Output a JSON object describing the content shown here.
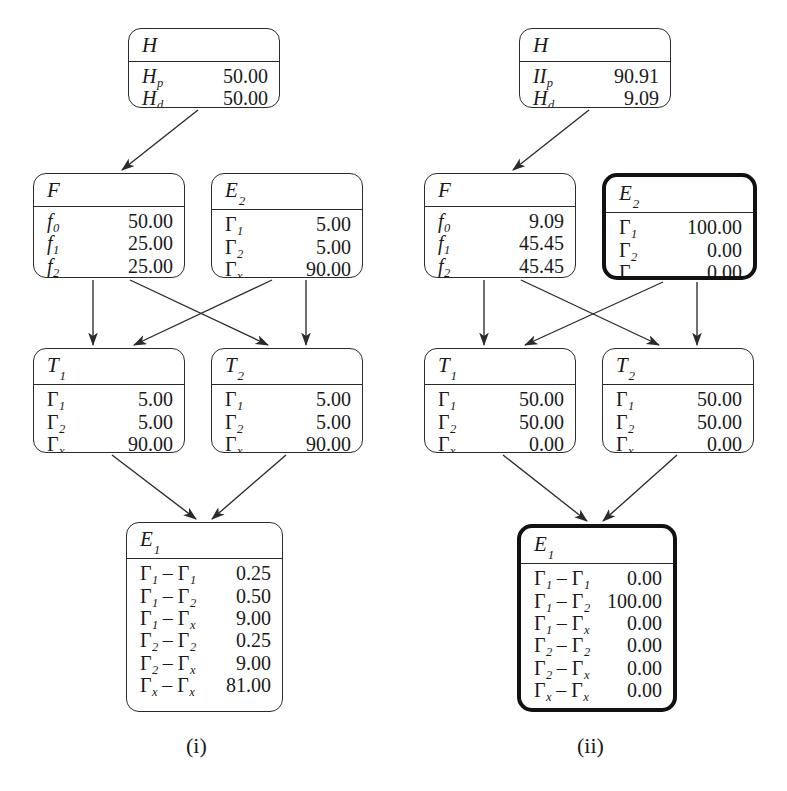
{
  "figure": {
    "background": "#ffffff",
    "line_color": "#2b2b2b",
    "panels": [
      {
        "caption": "(i)",
        "caption_x": 186,
        "caption_y": 733,
        "nodes": [
          {
            "id": "H",
            "title": "H",
            "title_sub": "",
            "x": 128,
            "y": 28,
            "w": 152,
            "h": 80,
            "emphasis": "normal",
            "rows": [
              {
                "key": "H",
                "key_sub": "p",
                "greek": false,
                "value": "50.00"
              },
              {
                "key": "H",
                "key_sub": "d",
                "greek": false,
                "value": "50.00"
              }
            ]
          },
          {
            "id": "F",
            "title": "F",
            "title_sub": "",
            "x": 33,
            "y": 173,
            "w": 152,
            "h": 105,
            "emphasis": "normal",
            "rows": [
              {
                "key": "f",
                "key_sub": "0",
                "greek": false,
                "value": "50.00"
              },
              {
                "key": "f",
                "key_sub": "1",
                "greek": false,
                "value": "25.00"
              },
              {
                "key": "f",
                "key_sub": "2",
                "greek": false,
                "value": "25.00"
              }
            ]
          },
          {
            "id": "E2",
            "title": "E",
            "title_sub": "2",
            "x": 211,
            "y": 173,
            "w": 152,
            "h": 105,
            "emphasis": "normal",
            "rows": [
              {
                "key": "Γ",
                "key_sub": "1",
                "greek": true,
                "value": "5.00"
              },
              {
                "key": "Γ",
                "key_sub": "2",
                "greek": true,
                "value": "5.00"
              },
              {
                "key": "Γ",
                "key_sub": "x",
                "greek": true,
                "value": "90.00"
              }
            ]
          },
          {
            "id": "T1",
            "title": "T",
            "title_sub": "1",
            "x": 33,
            "y": 348,
            "w": 152,
            "h": 105,
            "emphasis": "normal",
            "rows": [
              {
                "key": "Γ",
                "key_sub": "1",
                "greek": true,
                "value": "5.00"
              },
              {
                "key": "Γ",
                "key_sub": "2",
                "greek": true,
                "value": "5.00"
              },
              {
                "key": "Γ",
                "key_sub": "x",
                "greek": true,
                "value": "90.00"
              }
            ]
          },
          {
            "id": "T2",
            "title": "T",
            "title_sub": "2",
            "x": 211,
            "y": 348,
            "w": 152,
            "h": 105,
            "emphasis": "normal",
            "rows": [
              {
                "key": "Γ",
                "key_sub": "1",
                "greek": true,
                "value": "5.00"
              },
              {
                "key": "Γ",
                "key_sub": "2",
                "greek": true,
                "value": "5.00"
              },
              {
                "key": "Γ",
                "key_sub": "x",
                "greek": true,
                "value": "90.00"
              }
            ]
          },
          {
            "id": "E1",
            "title": "E",
            "title_sub": "1",
            "x": 126,
            "y": 522,
            "w": 157,
            "h": 190,
            "emphasis": "normal",
            "rows": [
              {
                "key": "Γ|1| – Γ|1|",
                "key_sub": "",
                "greek": true,
                "value": "0.25"
              },
              {
                "key": "Γ|1| – Γ|2|",
                "key_sub": "",
                "greek": true,
                "value": "0.50"
              },
              {
                "key": "Γ|1| – Γ|x|",
                "key_sub": "",
                "greek": true,
                "value": "9.00"
              },
              {
                "key": "Γ|2| – Γ|2|",
                "key_sub": "",
                "greek": true,
                "value": "0.25"
              },
              {
                "key": "Γ|2| – Γ|x|",
                "key_sub": "",
                "greek": true,
                "value": "9.00"
              },
              {
                "key": "Γ|x| – Γ|x|",
                "key_sub": "",
                "greek": true,
                "value": "81.00"
              }
            ]
          }
        ],
        "edges": [
          {
            "from": "H",
            "to": "F",
            "x1": 198,
            "y1": 110,
            "x2": 122,
            "y2": 170
          },
          {
            "from": "F",
            "to": "T1",
            "x1": 93,
            "y1": 280,
            "x2": 93,
            "y2": 345
          },
          {
            "from": "F",
            "to": "T2",
            "x1": 130,
            "y1": 280,
            "x2": 268,
            "y2": 345
          },
          {
            "from": "E2",
            "to": "T1",
            "x1": 272,
            "y1": 280,
            "x2": 134,
            "y2": 345
          },
          {
            "from": "E2",
            "to": "T2",
            "x1": 306,
            "y1": 280,
            "x2": 306,
            "y2": 345
          },
          {
            "from": "T1",
            "to": "E1",
            "x1": 112,
            "y1": 455,
            "x2": 196,
            "y2": 519
          },
          {
            "from": "T2",
            "to": "E1",
            "x1": 286,
            "y1": 455,
            "x2": 212,
            "y2": 519
          }
        ]
      },
      {
        "caption": "(ii)",
        "caption_x": 577,
        "caption_y": 733,
        "nodes": [
          {
            "id": "H",
            "title": "H",
            "title_sub": "",
            "x": 519,
            "y": 28,
            "w": 152,
            "h": 80,
            "emphasis": "normal",
            "rows": [
              {
                "key": "II",
                "key_sub": "p",
                "greek": false,
                "value": "90.91"
              },
              {
                "key": "H",
                "key_sub": "d",
                "greek": false,
                "value": "9.09"
              }
            ]
          },
          {
            "id": "F",
            "title": "F",
            "title_sub": "",
            "x": 424,
            "y": 173,
            "w": 152,
            "h": 105,
            "emphasis": "normal",
            "rows": [
              {
                "key": "f",
                "key_sub": "0",
                "greek": false,
                "value": "9.09"
              },
              {
                "key": "f",
                "key_sub": "1",
                "greek": false,
                "value": "45.45"
              },
              {
                "key": "f",
                "key_sub": "2",
                "greek": false,
                "value": "45.45"
              }
            ]
          },
          {
            "id": "E2",
            "title": "E",
            "title_sub": "2",
            "x": 602,
            "y": 173,
            "w": 155,
            "h": 107,
            "emphasis": "thick",
            "rows": [
              {
                "key": "Γ",
                "key_sub": "1",
                "greek": true,
                "value": "100.00"
              },
              {
                "key": "Γ",
                "key_sub": "2",
                "greek": true,
                "value": "0.00"
              },
              {
                "key": "Γ",
                "key_sub": "x",
                "greek": true,
                "value": "0.00"
              }
            ]
          },
          {
            "id": "T1",
            "title": "T",
            "title_sub": "1",
            "x": 424,
            "y": 348,
            "w": 152,
            "h": 105,
            "emphasis": "normal",
            "rows": [
              {
                "key": "Γ",
                "key_sub": "1",
                "greek": true,
                "value": "50.00"
              },
              {
                "key": "Γ",
                "key_sub": "2",
                "greek": true,
                "value": "50.00"
              },
              {
                "key": "Γ",
                "key_sub": "x",
                "greek": true,
                "value": "0.00"
              }
            ]
          },
          {
            "id": "T2",
            "title": "T",
            "title_sub": "2",
            "x": 602,
            "y": 348,
            "w": 152,
            "h": 105,
            "emphasis": "normal",
            "rows": [
              {
                "key": "Γ",
                "key_sub": "1",
                "greek": true,
                "value": "50.00"
              },
              {
                "key": "Γ",
                "key_sub": "2",
                "greek": true,
                "value": "50.00"
              },
              {
                "key": "Γ",
                "key_sub": "x",
                "greek": true,
                "value": "0.00"
              }
            ]
          },
          {
            "id": "E1",
            "title": "E",
            "title_sub": "1",
            "x": 517,
            "y": 524,
            "w": 160,
            "h": 188,
            "emphasis": "thick",
            "rows": [
              {
                "key": "Γ|1| – Γ|1|",
                "key_sub": "",
                "greek": true,
                "value": "0.00"
              },
              {
                "key": "Γ|1| – Γ|2|",
                "key_sub": "",
                "greek": true,
                "value": "100.00"
              },
              {
                "key": "Γ|1| – Γ|x|",
                "key_sub": "",
                "greek": true,
                "value": "0.00"
              },
              {
                "key": "Γ|2| – Γ|2|",
                "key_sub": "",
                "greek": true,
                "value": "0.00"
              },
              {
                "key": "Γ|2| – Γ|x|",
                "key_sub": "",
                "greek": true,
                "value": "0.00"
              },
              {
                "key": "Γ|x| – Γ|x|",
                "key_sub": "",
                "greek": true,
                "value": "0.00"
              }
            ]
          }
        ],
        "edges": [
          {
            "from": "H",
            "to": "F",
            "x1": 589,
            "y1": 110,
            "x2": 513,
            "y2": 170
          },
          {
            "from": "F",
            "to": "T1",
            "x1": 484,
            "y1": 280,
            "x2": 484,
            "y2": 345
          },
          {
            "from": "F",
            "to": "T2",
            "x1": 521,
            "y1": 280,
            "x2": 659,
            "y2": 345
          },
          {
            "from": "E2",
            "to": "T1",
            "x1": 663,
            "y1": 282,
            "x2": 525,
            "y2": 345
          },
          {
            "from": "E2",
            "to": "T2",
            "x1": 697,
            "y1": 282,
            "x2": 697,
            "y2": 345
          },
          {
            "from": "T1",
            "to": "E1",
            "x1": 503,
            "y1": 455,
            "x2": 587,
            "y2": 521
          },
          {
            "from": "T2",
            "to": "E1",
            "x1": 677,
            "y1": 455,
            "x2": 603,
            "y2": 521
          }
        ]
      }
    ]
  }
}
